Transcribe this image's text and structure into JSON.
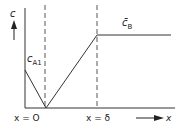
{
  "diagram": {
    "type": "concentration-profile",
    "y_axis_label": "c",
    "x_axis_label": "x",
    "labels": {
      "left_conc": {
        "main": "c",
        "sub": "A1"
      },
      "right_conc": {
        "main": "c̄",
        "sub": "B"
      },
      "x_zero": "x = O",
      "x_delta": "x = δ"
    },
    "colors": {
      "line": "#333333",
      "dashed": "#555555",
      "text": "#222222"
    },
    "geometry": {
      "y_axis_x": 25,
      "baseline_y": 108,
      "x_zero_px": 45,
      "x_delta_px": 97,
      "c_A1_px": 70,
      "c_B_px": 35,
      "right_end_px": 171
    }
  }
}
